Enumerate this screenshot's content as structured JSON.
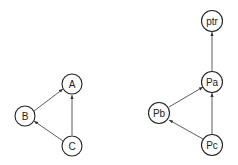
{
  "diagrams": [
    {
      "name": "left-graph",
      "nodes": [
        {
          "id": "A",
          "label": "A"
        },
        {
          "id": "B",
          "label": "B"
        },
        {
          "id": "C",
          "label": "C"
        }
      ],
      "edges": [
        {
          "from": "B",
          "to": "A"
        },
        {
          "from": "C",
          "to": "A"
        },
        {
          "from": "C",
          "to": "B"
        }
      ]
    },
    {
      "name": "right-graph",
      "nodes": [
        {
          "id": "ptr",
          "label": "ptr"
        },
        {
          "id": "Pa",
          "label": "Pa"
        },
        {
          "id": "Pb",
          "label": "Pb"
        },
        {
          "id": "Pc",
          "label": "Pc"
        }
      ],
      "edges": [
        {
          "from": "Pa",
          "to": "ptr"
        },
        {
          "from": "Pb",
          "to": "Pa"
        },
        {
          "from": "Pc",
          "to": "Pa"
        },
        {
          "from": "Pc",
          "to": "Pb"
        }
      ]
    }
  ]
}
